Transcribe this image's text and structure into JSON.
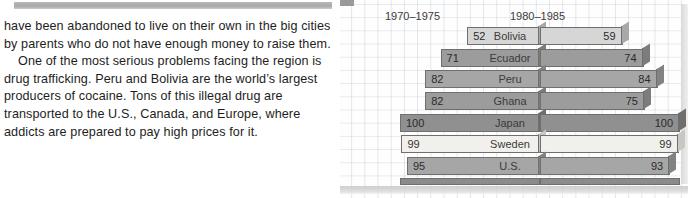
{
  "article": {
    "paragraphs": [
      {
        "indent": false,
        "text": "have been abandoned to live on their own in the big cities by parents who do not have enough money to raise them."
      },
      {
        "indent": true,
        "text": "One of the most serious problems facing the region is drug trafficking. Peru and Bolivia are the world’s largest producers of cocaine. Tons of this illegal drug are transported to the U.S., Canada, and Europe, where addicts are prepared to pay high prices for it."
      }
    ]
  },
  "chart_data": {
    "type": "bar",
    "title": "",
    "orientation": "horizontal",
    "grid": true,
    "legend_position": "top",
    "xlabel": "",
    "ylabel": "",
    "xlim": [
      0,
      100
    ],
    "categories": [
      "Bolivia",
      "Ecuador",
      "Peru",
      "Ghana",
      "Japan",
      "Sweden",
      "U.S."
    ],
    "series": [
      {
        "name": "1970–1975",
        "values": [
          52,
          71,
          82,
          82,
          100,
          99,
          95
        ]
      },
      {
        "name": "1980–1985",
        "values": [
          59,
          74,
          84,
          75,
          100,
          99,
          93
        ]
      }
    ],
    "row_tones": [
      "t-light",
      "t-mid",
      "t-mid2",
      "t-mid",
      "t-dark",
      "t-pale",
      "t-mid2"
    ],
    "colors": {
      "light": "#d6d6d6",
      "mid": "#9c9c9c",
      "mid2": "#a6a6a6",
      "dark": "#909090",
      "pale": "#f2f0ec",
      "outline": "#6f6f6f",
      "grid": "#96a0af"
    }
  }
}
